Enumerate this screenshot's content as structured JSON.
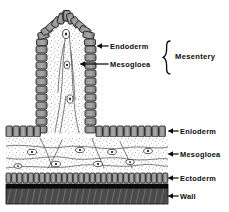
{
  "figure": {
    "title": "Mesentery",
    "background_color": "#ffffff",
    "ink_color": "#111111"
  },
  "labels": {
    "endoderm_top": "Endoderm",
    "mesogloea_top": "Mesogloea",
    "mesentery_group": "Mesentery",
    "endoderm_bottom": "Enloderm",
    "mesogloea_bottom": "Mesogloea",
    "ectoderm": "Ectoderm",
    "wall": "Wall"
  },
  "structures": [
    {
      "name": "mesentery-fold",
      "description": "Vertical finger-like fold projecting upward from the body wall",
      "layers": [
        "endoderm",
        "mesogloea"
      ]
    },
    {
      "name": "body-wall",
      "description": "Horizontal layered body wall at base of figure",
      "layers": [
        "endoderm",
        "mesogloea",
        "ectoderm",
        "wall"
      ]
    }
  ],
  "annotations": [
    {
      "label": "Endoderm",
      "target": "mesentery-endoderm",
      "arrow": "left"
    },
    {
      "label": "Mesogloea",
      "target": "mesentery-mesogloea",
      "arrow": "left"
    },
    {
      "label": "Mesentery",
      "target": "mesentery-fold",
      "arrow": "brace"
    },
    {
      "label": "Enloderm",
      "target": "wall-endoderm",
      "arrow": "left"
    },
    {
      "label": "Mesogloea",
      "target": "wall-mesogloea",
      "arrow": "left"
    },
    {
      "label": "Ectoderm",
      "target": "wall-ectoderm",
      "arrow": "left"
    },
    {
      "label": "Wall",
      "target": "wall-band",
      "arrow": "left"
    }
  ]
}
